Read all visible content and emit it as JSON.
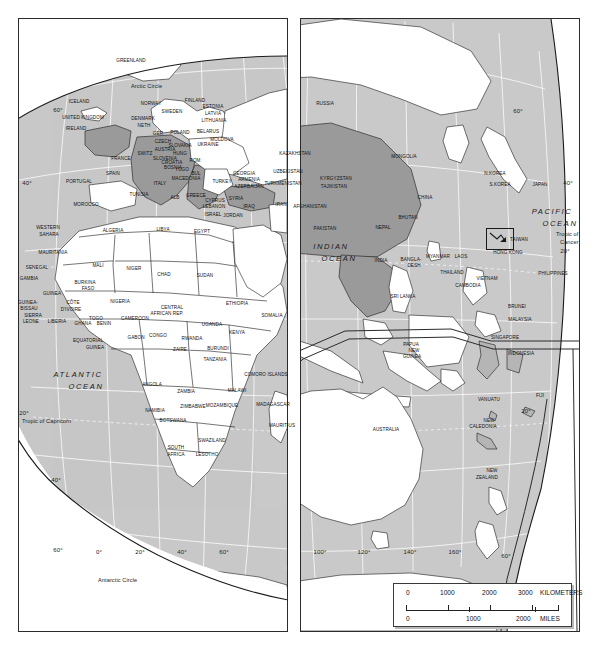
{
  "colors": {
    "ocean": "#c9c9c9",
    "land": "#ffffff",
    "highlight": "#9a9a9a",
    "outline": "#1a1a1a",
    "graticule": "#ffffff",
    "frame": "#2b2b2b"
  },
  "main_panel": {
    "name": "eastern-hemisphere-globe",
    "oceans": [
      {
        "label": "ATLANTIC",
        "label2": "OCEAN",
        "x": 78,
        "y": 371
      },
      {
        "label": "INDIAN",
        "label2": "OCEAN",
        "x": 331,
        "y": 243
      },
      {
        "label": "PACIFIC",
        "label2": "OCEAN",
        "x": 552,
        "y": 208
      }
    ],
    "reference_lines": [
      {
        "label": "Arctic Circle",
        "x": 131,
        "y": 84
      },
      {
        "label": "Tropic of Capricorn",
        "x": 22,
        "y": 419
      },
      {
        "label": "Antarctic Circle",
        "x": 98,
        "y": 578
      },
      {
        "label": "Tropic of",
        "x": 556,
        "y": 232
      },
      {
        "label": "Cancer",
        "x": 560,
        "y": 240
      }
    ],
    "graticule_labels": [
      {
        "t": "60°",
        "x": 58,
        "y": 107
      },
      {
        "t": "40°",
        "x": 27,
        "y": 180
      },
      {
        "t": "20°",
        "x": 24,
        "y": 410
      },
      {
        "t": "40°",
        "x": 56,
        "y": 477
      },
      {
        "t": "60°",
        "x": 58,
        "y": 547
      },
      {
        "t": "0°",
        "x": 99,
        "y": 549
      },
      {
        "t": "20°",
        "x": 140,
        "y": 549
      },
      {
        "t": "40°",
        "x": 182,
        "y": 549
      },
      {
        "t": "60°",
        "x": 224,
        "y": 549
      },
      {
        "t": "60°",
        "x": 518,
        "y": 108
      },
      {
        "t": "40°",
        "x": 568,
        "y": 180
      },
      {
        "t": "20°",
        "x": 565,
        "y": 248
      }
    ],
    "countries": [
      {
        "n": "GREENLAND",
        "x": 131,
        "y": 59,
        "hi": false
      },
      {
        "n": "ICELAND",
        "x": 79,
        "y": 100,
        "hi": false
      },
      {
        "n": "NORWAY",
        "x": 151,
        "y": 102,
        "hi": false
      },
      {
        "n": "SWEDEN",
        "x": 172,
        "y": 110,
        "hi": false
      },
      {
        "n": "FINLAND",
        "x": 195,
        "y": 99,
        "hi": false
      },
      {
        "n": "ESTONIA",
        "x": 213,
        "y": 105,
        "hi": false
      },
      {
        "n": "LATVIA",
        "x": 213,
        "y": 112,
        "hi": false
      },
      {
        "n": "LITHUANIA",
        "x": 214,
        "y": 119,
        "hi": false
      },
      {
        "n": "UNITED KINGDOM",
        "x": 83,
        "y": 116,
        "hi": true
      },
      {
        "n": "IRELAND",
        "x": 76,
        "y": 127,
        "hi": true
      },
      {
        "n": "DENMARK",
        "x": 143,
        "y": 117,
        "hi": true
      },
      {
        "n": "NETH",
        "x": 144,
        "y": 124,
        "hi": true
      },
      {
        "n": "GER",
        "x": 158,
        "y": 132,
        "hi": true
      },
      {
        "n": "POLAND",
        "x": 180,
        "y": 131,
        "hi": false
      },
      {
        "n": "BELARUS",
        "x": 208,
        "y": 130,
        "hi": false
      },
      {
        "n": "MOLDOVA",
        "x": 222,
        "y": 138,
        "hi": false
      },
      {
        "n": "UKRAINE",
        "x": 208,
        "y": 143,
        "hi": false
      },
      {
        "n": "CZECH",
        "x": 163,
        "y": 140,
        "hi": true
      },
      {
        "n": "SLOVAKIA",
        "x": 180,
        "y": 144,
        "hi": true
      },
      {
        "n": "AUSTRIA",
        "x": 165,
        "y": 148,
        "hi": true
      },
      {
        "n": "HUNG",
        "x": 180,
        "y": 152,
        "hi": true
      },
      {
        "n": "SWITZ",
        "x": 145,
        "y": 152,
        "hi": true
      },
      {
        "n": "FRANCE",
        "x": 121,
        "y": 157,
        "hi": true
      },
      {
        "n": "SLOVENIA",
        "x": 165,
        "y": 157,
        "hi": true
      },
      {
        "n": "CROATIA",
        "x": 172,
        "y": 161,
        "hi": true
      },
      {
        "n": "BOSNIA",
        "x": 173,
        "y": 166,
        "hi": true
      },
      {
        "n": "ROM",
        "x": 195,
        "y": 159,
        "hi": false
      },
      {
        "n": "YUGO",
        "x": 182,
        "y": 168,
        "hi": true
      },
      {
        "n": "BUL",
        "x": 196,
        "y": 172,
        "hi": false
      },
      {
        "n": "SPAIN",
        "x": 113,
        "y": 172,
        "hi": false
      },
      {
        "n": "PORTUGAL",
        "x": 79,
        "y": 180,
        "hi": false
      },
      {
        "n": "ITALY",
        "x": 160,
        "y": 182,
        "hi": true
      },
      {
        "n": "MACEDONIA",
        "x": 186,
        "y": 177,
        "hi": true
      },
      {
        "n": "ALB",
        "x": 175,
        "y": 196,
        "hi": false
      },
      {
        "n": "GREECE",
        "x": 196,
        "y": 194,
        "hi": false
      },
      {
        "n": "TURKEY",
        "x": 222,
        "y": 180,
        "hi": true
      },
      {
        "n": "GEORGIA",
        "x": 244,
        "y": 172,
        "hi": false
      },
      {
        "n": "ARMENIA",
        "x": 249,
        "y": 178,
        "hi": true
      },
      {
        "n": "AZERBAIJAN",
        "x": 249,
        "y": 185,
        "hi": true
      },
      {
        "n": "CYPRUS",
        "x": 215,
        "y": 199,
        "hi": true
      },
      {
        "n": "LEBANON",
        "x": 214,
        "y": 205,
        "hi": false
      },
      {
        "n": "SYRIA",
        "x": 236,
        "y": 197,
        "hi": false
      },
      {
        "n": "ISRAEL",
        "x": 213,
        "y": 213,
        "hi": false
      },
      {
        "n": "JORDAN",
        "x": 233,
        "y": 214,
        "hi": false
      },
      {
        "n": "IRAQ",
        "x": 249,
        "y": 205,
        "hi": false
      },
      {
        "n": "IRAN",
        "x": 281,
        "y": 203,
        "hi": false
      },
      {
        "n": "TUNISIA",
        "x": 139,
        "y": 193,
        "hi": false
      },
      {
        "n": "MOROCCO",
        "x": 86,
        "y": 203,
        "hi": false
      },
      {
        "n": "ALGERIA",
        "x": 113,
        "y": 229,
        "hi": false
      },
      {
        "n": "LIBYA",
        "x": 163,
        "y": 228,
        "hi": false
      },
      {
        "n": "EGYPT",
        "x": 202,
        "y": 230,
        "hi": false
      },
      {
        "n": "WESTERN",
        "x": 48,
        "y": 226,
        "hi": false
      },
      {
        "n": "SAHARA",
        "x": 49,
        "y": 233,
        "hi": false
      },
      {
        "n": "MAURITANIA",
        "x": 53,
        "y": 251,
        "hi": false
      },
      {
        "n": "MALI",
        "x": 98,
        "y": 264,
        "hi": false
      },
      {
        "n": "NIGER",
        "x": 134,
        "y": 267,
        "hi": false
      },
      {
        "n": "CHAD",
        "x": 164,
        "y": 273,
        "hi": false
      },
      {
        "n": "SUDAN",
        "x": 205,
        "y": 274,
        "hi": false
      },
      {
        "n": "SENEGAL",
        "x": 37,
        "y": 266,
        "hi": false
      },
      {
        "n": "GAMBIA",
        "x": 29,
        "y": 277,
        "hi": false
      },
      {
        "n": "BURKINA",
        "x": 85,
        "y": 281,
        "hi": false
      },
      {
        "n": "FASO",
        "x": 88,
        "y": 287,
        "hi": false
      },
      {
        "n": "GUINEA",
        "x": 52,
        "y": 292,
        "hi": false
      },
      {
        "n": "GUINEA-",
        "x": 28,
        "y": 301,
        "hi": false
      },
      {
        "n": "BISSAU",
        "x": 29,
        "y": 307,
        "hi": false
      },
      {
        "n": "SIERRA",
        "x": 33,
        "y": 314,
        "hi": false
      },
      {
        "n": "LEONE",
        "x": 31,
        "y": 320,
        "hi": false
      },
      {
        "n": "LIBERIA",
        "x": 57,
        "y": 320,
        "hi": false
      },
      {
        "n": "CÔTE",
        "x": 73,
        "y": 301,
        "hi": false
      },
      {
        "n": "D'IVOIRE",
        "x": 71,
        "y": 308,
        "hi": false
      },
      {
        "n": "GHANA",
        "x": 83,
        "y": 322,
        "hi": false
      },
      {
        "n": "TOGO",
        "x": 96,
        "y": 317,
        "hi": false
      },
      {
        "n": "BENIN",
        "x": 104,
        "y": 322,
        "hi": false
      },
      {
        "n": "NIGERIA",
        "x": 120,
        "y": 300,
        "hi": false
      },
      {
        "n": "CAMEROON",
        "x": 135,
        "y": 317,
        "hi": false
      },
      {
        "n": "CENTRAL",
        "x": 172,
        "y": 306,
        "hi": false
      },
      {
        "n": "AFRICAN REP.",
        "x": 167,
        "y": 312,
        "hi": false
      },
      {
        "n": "ETHIOPIA",
        "x": 237,
        "y": 302,
        "hi": false
      },
      {
        "n": "SOMALIA",
        "x": 272,
        "y": 314,
        "hi": false
      },
      {
        "n": "UGANDA",
        "x": 212,
        "y": 323,
        "hi": false
      },
      {
        "n": "KENYA",
        "x": 237,
        "y": 331,
        "hi": false
      },
      {
        "n": "EQUATORIAL",
        "x": 88,
        "y": 339,
        "hi": false
      },
      {
        "n": "GUINEA",
        "x": 95,
        "y": 346,
        "hi": false
      },
      {
        "n": "GABON",
        "x": 136,
        "y": 336,
        "hi": false
      },
      {
        "n": "CONGO",
        "x": 158,
        "y": 334,
        "hi": false
      },
      {
        "n": "ZAIRE",
        "x": 180,
        "y": 348,
        "hi": false
      },
      {
        "n": "RWANDA",
        "x": 192,
        "y": 337,
        "hi": false
      },
      {
        "n": "BURUNDI",
        "x": 218,
        "y": 347,
        "hi": false
      },
      {
        "n": "TANZANIA",
        "x": 215,
        "y": 358,
        "hi": false
      },
      {
        "n": "ANGOLA",
        "x": 152,
        "y": 383,
        "hi": false
      },
      {
        "n": "ZAMBIA",
        "x": 186,
        "y": 390,
        "hi": false
      },
      {
        "n": "MALAWI",
        "x": 237,
        "y": 389,
        "hi": false
      },
      {
        "n": "ZIMBABWE",
        "x": 193,
        "y": 405,
        "hi": false
      },
      {
        "n": "MOZAMBIQUE",
        "x": 222,
        "y": 404,
        "hi": false
      },
      {
        "n": "NAMIBIA",
        "x": 155,
        "y": 409,
        "hi": false
      },
      {
        "n": "BOTSWANA",
        "x": 173,
        "y": 419,
        "hi": false
      },
      {
        "n": "SOUTH",
        "x": 176,
        "y": 446,
        "hi": false
      },
      {
        "n": "AFRICA",
        "x": 176,
        "y": 453,
        "hi": false
      },
      {
        "n": "SWAZILAND",
        "x": 212,
        "y": 439,
        "hi": false
      },
      {
        "n": "LESOTHO",
        "x": 207,
        "y": 453,
        "hi": false
      },
      {
        "n": "MADAGASCAR",
        "x": 273,
        "y": 403,
        "hi": false
      },
      {
        "n": "COMORO ISLANDS",
        "x": 266,
        "y": 373,
        "hi": false
      },
      {
        "n": "MAURITIUS",
        "x": 282,
        "y": 424,
        "hi": false
      },
      {
        "n": "RUSSIA",
        "x": 325,
        "y": 102,
        "hi": false
      },
      {
        "n": "KAZAKHSTAN",
        "x": 295,
        "y": 152,
        "hi": false
      },
      {
        "n": "UZBEKISTAN",
        "x": 288,
        "y": 170,
        "hi": false
      },
      {
        "n": "TURKMENISTAN",
        "x": 283,
        "y": 182,
        "hi": false
      },
      {
        "n": "KYRGYZSTAN",
        "x": 336,
        "y": 177,
        "hi": false
      },
      {
        "n": "TAJIKISTAN",
        "x": 334,
        "y": 185,
        "hi": false
      },
      {
        "n": "AFGHANISTAN",
        "x": 310,
        "y": 205,
        "hi": false
      },
      {
        "n": "PAKISTAN",
        "x": 325,
        "y": 227,
        "hi": true
      },
      {
        "n": "MONGOLIA",
        "x": 404,
        "y": 155,
        "hi": false
      },
      {
        "n": "CHINA",
        "x": 425,
        "y": 196,
        "hi": true
      },
      {
        "n": "NEPAL",
        "x": 383,
        "y": 226,
        "hi": true
      },
      {
        "n": "BHUTAN",
        "x": 408,
        "y": 216,
        "hi": true
      },
      {
        "n": "INDIA",
        "x": 381,
        "y": 259,
        "hi": true
      },
      {
        "n": "BANGLA-",
        "x": 411,
        "y": 258,
        "hi": false
      },
      {
        "n": "DESH",
        "x": 414,
        "y": 264,
        "hi": false
      },
      {
        "n": "SRI LANKA",
        "x": 403,
        "y": 295,
        "hi": false
      },
      {
        "n": "MYANMAR",
        "x": 438,
        "y": 255,
        "hi": true
      },
      {
        "n": "LAOS",
        "x": 461,
        "y": 255,
        "hi": true
      },
      {
        "n": "THAILAND",
        "x": 452,
        "y": 271,
        "hi": true
      },
      {
        "n": "CAMBODIA",
        "x": 468,
        "y": 284,
        "hi": true
      },
      {
        "n": "VIETNAM",
        "x": 487,
        "y": 277,
        "hi": false
      },
      {
        "n": "N.KOREA",
        "x": 495,
        "y": 172,
        "hi": false
      },
      {
        "n": "S.KOREA",
        "x": 500,
        "y": 183,
        "hi": false
      },
      {
        "n": "JAPAN",
        "x": 540,
        "y": 183,
        "hi": false
      },
      {
        "n": "TAIWAN",
        "x": 519,
        "y": 238,
        "hi": false
      },
      {
        "n": "HONG KONG",
        "x": 508,
        "y": 251,
        "hi": false
      },
      {
        "n": "PHILIPPINES",
        "x": 553,
        "y": 272,
        "hi": false
      },
      {
        "n": "BRUNEI",
        "x": 517,
        "y": 305,
        "hi": false
      },
      {
        "n": "MALAYSIA",
        "x": 520,
        "y": 318,
        "hi": false
      },
      {
        "n": "SINGAPORE",
        "x": 505,
        "y": 336,
        "hi": false
      },
      {
        "n": "INDONESIA",
        "x": 521,
        "y": 352,
        "hi": false
      }
    ]
  },
  "inset_panel": {
    "name": "australia-oceania-inset",
    "countries": [
      {
        "n": "PAPUA",
        "x": 411,
        "y": 343
      },
      {
        "n": "NEW",
        "x": 414,
        "y": 349
      },
      {
        "n": "GUINEA",
        "x": 412,
        "y": 355
      },
      {
        "n": "AUSTRALIA",
        "x": 386,
        "y": 428
      },
      {
        "n": "VANUATU",
        "x": 489,
        "y": 398
      },
      {
        "n": "FIJI",
        "x": 540,
        "y": 394
      },
      {
        "n": "NEW",
        "x": 489,
        "y": 419
      },
      {
        "n": "CALEDONIA",
        "x": 483,
        "y": 425
      },
      {
        "n": "NEW",
        "x": 492,
        "y": 469
      },
      {
        "n": "ZEALAND",
        "x": 487,
        "y": 476
      }
    ],
    "graticule_labels": [
      {
        "t": "100°",
        "x": 320,
        "y": 549
      },
      {
        "t": "120°",
        "x": 364,
        "y": 549
      },
      {
        "t": "140°",
        "x": 410,
        "y": 549
      },
      {
        "t": "160°",
        "x": 455,
        "y": 549
      },
      {
        "t": "20°",
        "x": 526,
        "y": 408
      },
      {
        "t": "60°",
        "x": 506,
        "y": 553
      }
    ]
  },
  "scale_bar": {
    "name": "map-scale-bar",
    "km_ticks": [
      "0",
      "1000",
      "2000",
      "3000"
    ],
    "km_unit": "KILOMETERS",
    "mi_ticks": [
      "0",
      "1000",
      "2000"
    ],
    "mi_unit": "MILES"
  }
}
